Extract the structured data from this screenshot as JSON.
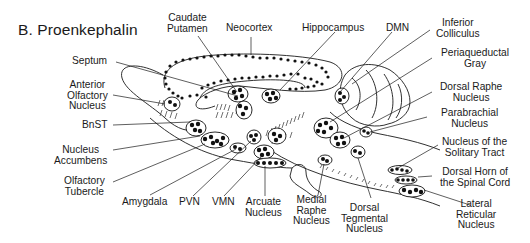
{
  "figure": {
    "title": "B. Proenkephalin",
    "labels": {
      "caudate_putamen": [
        "Caudate",
        "Putamen"
      ],
      "neocortex": [
        "Neocortex"
      ],
      "hippocampus": [
        "Hippocampus"
      ],
      "dmn": [
        "DMN"
      ],
      "inferior_colliculus": [
        "Inferior",
        "Colliculus"
      ],
      "periaqueductal_gray": [
        "Periaqueductal",
        "Gray"
      ],
      "dorsal_raphe_nucleus": [
        "Dorsal Raphe",
        "Nucleus"
      ],
      "parabrachial_nucleus": [
        "Parabrachial",
        "Nucleus"
      ],
      "nucleus_solitary_tract": [
        "Nucleus of the",
        "Solitary Tract"
      ],
      "dorsal_horn_spinal_cord": [
        "Dorsal Horn of",
        "the Spinal Cord"
      ],
      "lateral_reticular_nucleus": [
        "Lateral",
        "Reticular",
        "Nucleus"
      ],
      "septum": [
        "Septum"
      ],
      "anterior_olfactory_nucleus": [
        "Anterior",
        "Olfactory",
        "Nucleus"
      ],
      "bnst": [
        "BnST"
      ],
      "nucleus_accumbens": [
        "Nucleus",
        "Accumbens"
      ],
      "olfactory_tubercle": [
        "Olfactory",
        "Tubercle"
      ],
      "amygdala": [
        "Amygdala"
      ],
      "pvn": [
        "PVN"
      ],
      "vmn": [
        "VMN"
      ],
      "arcuate_nucleus": [
        "Arcuate",
        "Nucleus"
      ],
      "medial_raphe_nucleus": [
        "Medial",
        "Raphe",
        "Nucleus"
      ],
      "dorsal_tegmental_nucleus": [
        "Dorsal",
        "Tegmental",
        "Nucleus"
      ]
    },
    "colors": {
      "ink": "#1a1a1a",
      "background": "#ffffff"
    }
  }
}
